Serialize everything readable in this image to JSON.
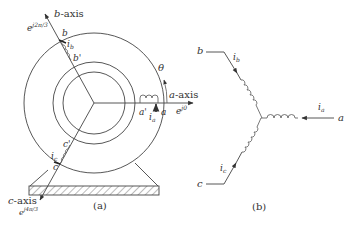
{
  "figure_a": {
    "caption": "(a)",
    "b_axis": {
      "label_var": "b",
      "label_suffix": "-axis",
      "phasor": "e",
      "phasor_exp": "j2π/3"
    },
    "a_axis": {
      "label_var": "a",
      "label_suffix": "-axis",
      "phasor": "e",
      "phasor_exp": "j0"
    },
    "c_axis": {
      "label_var": "c",
      "label_suffix": "-axis",
      "phasor": "e",
      "phasor_exp": "j4π/3"
    },
    "angle_label": "θ",
    "winding_a": {
      "start": "a",
      "end": "a'",
      "current": "i",
      "current_sub": "a"
    },
    "winding_b": {
      "start": "b",
      "end": "b'",
      "current": "i",
      "current_sub": "b"
    },
    "winding_c": {
      "start": "c",
      "end": "c'",
      "current": "i",
      "current_sub": "c"
    }
  },
  "figure_b": {
    "caption": "(b)",
    "terminals": [
      {
        "name": "a",
        "current": "i",
        "current_sub": "a"
      },
      {
        "name": "b",
        "current": "i",
        "current_sub": "b"
      },
      {
        "name": "c",
        "current": "i",
        "current_sub": "c"
      }
    ]
  }
}
